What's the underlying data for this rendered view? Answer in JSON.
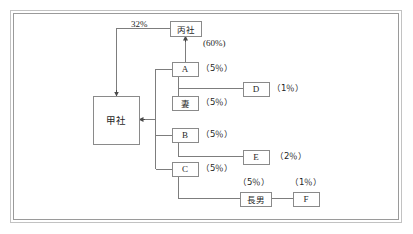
{
  "diagram": {
    "type": "ownership-structure-chart",
    "frame": {
      "style": "double-line-rectangle",
      "color": "#b6b6b6",
      "inner_color": "#8f8f8f"
    },
    "line_color": "#7a7a7a",
    "box_border_color": "#8a8a8a",
    "nodes": [
      {
        "id": "hei",
        "label": "丙社",
        "x": 170,
        "y": 21,
        "w": 31,
        "h": 15
      },
      {
        "id": "kou",
        "label": "甲社",
        "x": 93,
        "y": 96,
        "w": 46,
        "h": 48
      },
      {
        "id": "a",
        "label": "A",
        "x": 172,
        "y": 62,
        "w": 26,
        "h": 14
      },
      {
        "id": "tsuma",
        "label": "妻",
        "x": 172,
        "y": 96,
        "w": 26,
        "h": 14
      },
      {
        "id": "b",
        "label": "B",
        "x": 172,
        "y": 128,
        "w": 26,
        "h": 14
      },
      {
        "id": "c",
        "label": "C",
        "x": 172,
        "y": 162,
        "w": 26,
        "h": 14
      },
      {
        "id": "d",
        "label": "D",
        "x": 243,
        "y": 82,
        "w": 26,
        "h": 14
      },
      {
        "id": "e",
        "label": "E",
        "x": 243,
        "y": 150,
        "w": 26,
        "h": 14
      },
      {
        "id": "chonan",
        "label": "長男",
        "x": 240,
        "y": 192,
        "w": 31,
        "h": 14
      },
      {
        "id": "f",
        "label": "F",
        "x": 293,
        "y": 192,
        "w": 26,
        "h": 14
      }
    ],
    "annotations": [
      {
        "id": "ann-32",
        "text": "32%",
        "x": 131,
        "y": 20
      },
      {
        "id": "ann-hei-60",
        "text": "(60%)",
        "x": 203,
        "y": 41
      },
      {
        "id": "ann-a-5",
        "text": "（5％）",
        "x": 203,
        "y": 64
      },
      {
        "id": "ann-d-1",
        "text": "（1％）",
        "x": 274,
        "y": 84
      },
      {
        "id": "ann-tsuma-5",
        "text": "（5％）",
        "x": 203,
        "y": 98
      },
      {
        "id": "ann-b-5",
        "text": "（5％）",
        "x": 203,
        "y": 130
      },
      {
        "id": "ann-e-2",
        "text": "（2％）",
        "x": 277,
        "y": 152
      },
      {
        "id": "ann-c-5",
        "text": "（5％）",
        "x": 203,
        "y": 164
      },
      {
        "id": "ann-chonan-5",
        "text": "（5％）",
        "x": 240,
        "y": 177
      },
      {
        "id": "ann-f-1",
        "text": "（1％）",
        "x": 292,
        "y": 177
      }
    ]
  }
}
